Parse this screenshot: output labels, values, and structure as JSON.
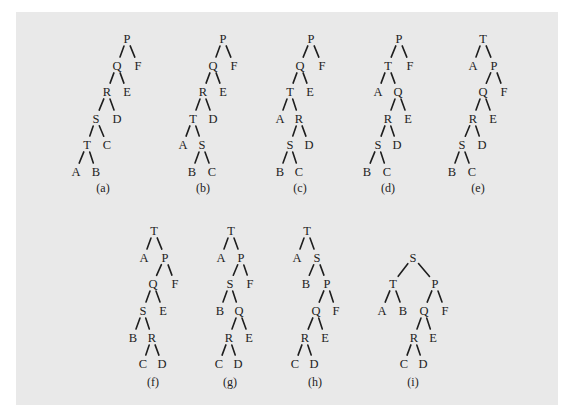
{
  "figure": {
    "background": "#e9e9e9",
    "ink_color": "#222222",
    "trees": [
      {
        "caption": "(a)",
        "caption_pos": [
          103,
          188
        ],
        "nodes": {
          "P": [
            127,
            38
          ],
          "Q": [
            117,
            65
          ],
          "F": [
            138,
            65
          ],
          "R": [
            107,
            91
          ],
          "E": [
            127,
            91
          ],
          "S": [
            96,
            118
          ],
          "D": [
            117,
            118
          ],
          "T": [
            87,
            144
          ],
          "C": [
            107,
            144
          ],
          "A": [
            76,
            171
          ],
          "B": [
            96,
            171
          ]
        },
        "edges": [
          [
            "P",
            "Q"
          ],
          [
            "P",
            "F"
          ],
          [
            "Q",
            "R"
          ],
          [
            "Q",
            "E"
          ],
          [
            "R",
            "S"
          ],
          [
            "R",
            "D"
          ],
          [
            "S",
            "T"
          ],
          [
            "S",
            "C"
          ],
          [
            "T",
            "A"
          ],
          [
            "T",
            "B"
          ]
        ]
      },
      {
        "caption": "(b)",
        "caption_pos": [
          203,
          188
        ],
        "nodes": {
          "P": [
            223,
            38
          ],
          "Q": [
            213,
            65
          ],
          "F": [
            234,
            65
          ],
          "R": [
            203,
            91
          ],
          "E": [
            223,
            91
          ],
          "T": [
            193,
            118
          ],
          "D": [
            213,
            118
          ],
          "A": [
            183,
            144
          ],
          "S": [
            202,
            144
          ],
          "B": [
            192,
            171
          ],
          "C": [
            212,
            171
          ]
        },
        "edges": [
          [
            "P",
            "Q"
          ],
          [
            "P",
            "F"
          ],
          [
            "Q",
            "R"
          ],
          [
            "Q",
            "E"
          ],
          [
            "R",
            "T"
          ],
          [
            "R",
            "D"
          ],
          [
            "T",
            "A"
          ],
          [
            "T",
            "S"
          ],
          [
            "S",
            "B"
          ],
          [
            "S",
            "C"
          ]
        ]
      },
      {
        "caption": "(c)",
        "caption_pos": [
          300,
          188
        ],
        "nodes": {
          "P": [
            311,
            38
          ],
          "Q": [
            300,
            65
          ],
          "F": [
            322,
            65
          ],
          "T": [
            290,
            91
          ],
          "E": [
            310,
            91
          ],
          "A": [
            280,
            118
          ],
          "R": [
            299,
            118
          ],
          "S": [
            290,
            144
          ],
          "D": [
            309,
            144
          ],
          "B": [
            280,
            171
          ],
          "C": [
            299,
            171
          ]
        },
        "edges": [
          [
            "P",
            "Q"
          ],
          [
            "P",
            "F"
          ],
          [
            "Q",
            "T"
          ],
          [
            "Q",
            "E"
          ],
          [
            "T",
            "A"
          ],
          [
            "T",
            "R"
          ],
          [
            "R",
            "S"
          ],
          [
            "R",
            "D"
          ],
          [
            "S",
            "B"
          ],
          [
            "S",
            "C"
          ]
        ]
      },
      {
        "caption": "(d)",
        "caption_pos": [
          388,
          188
        ],
        "nodes": {
          "P": [
            399,
            38
          ],
          "T": [
            388,
            65
          ],
          "F": [
            410,
            65
          ],
          "A": [
            378,
            91
          ],
          "Q": [
            398,
            91
          ],
          "R": [
            388,
            118
          ],
          "E": [
            408,
            118
          ],
          "S": [
            378,
            144
          ],
          "D": [
            397,
            144
          ],
          "B": [
            367,
            171
          ],
          "C": [
            387,
            171
          ]
        },
        "edges": [
          [
            "P",
            "T"
          ],
          [
            "P",
            "F"
          ],
          [
            "T",
            "A"
          ],
          [
            "T",
            "Q"
          ],
          [
            "Q",
            "R"
          ],
          [
            "Q",
            "E"
          ],
          [
            "R",
            "S"
          ],
          [
            "R",
            "D"
          ],
          [
            "S",
            "B"
          ],
          [
            "S",
            "C"
          ]
        ]
      },
      {
        "caption": "(e)",
        "caption_pos": [
          478,
          188
        ],
        "nodes": {
          "T": [
            483,
            38
          ],
          "A": [
            473,
            65
          ],
          "P": [
            494,
            65
          ],
          "Q": [
            483,
            91
          ],
          "F": [
            504,
            91
          ],
          "R": [
            473,
            118
          ],
          "E": [
            493,
            118
          ],
          "S": [
            462,
            144
          ],
          "D": [
            482,
            144
          ],
          "B": [
            452,
            171
          ],
          "C": [
            472,
            171
          ]
        },
        "edges": [
          [
            "T",
            "A"
          ],
          [
            "T",
            "P"
          ],
          [
            "P",
            "Q"
          ],
          [
            "P",
            "F"
          ],
          [
            "Q",
            "R"
          ],
          [
            "Q",
            "E"
          ],
          [
            "R",
            "S"
          ],
          [
            "R",
            "D"
          ],
          [
            "S",
            "B"
          ],
          [
            "S",
            "C"
          ]
        ]
      },
      {
        "caption": "(f)",
        "caption_pos": [
          153,
          382
        ],
        "nodes": {
          "T": [
            154,
            230
          ],
          "A": [
            144,
            257
          ],
          "P": [
            165,
            257
          ],
          "Q": [
            153,
            283
          ],
          "F": [
            175,
            283
          ],
          "S": [
            143,
            310
          ],
          "E": [
            163,
            310
          ],
          "B": [
            133,
            337
          ],
          "R": [
            152,
            337
          ],
          "C": [
            143,
            363
          ],
          "D": [
            162,
            363
          ]
        },
        "edges": [
          [
            "T",
            "A"
          ],
          [
            "T",
            "P"
          ],
          [
            "P",
            "Q"
          ],
          [
            "P",
            "F"
          ],
          [
            "Q",
            "S"
          ],
          [
            "Q",
            "E"
          ],
          [
            "S",
            "B"
          ],
          [
            "S",
            "R"
          ],
          [
            "R",
            "C"
          ],
          [
            "R",
            "D"
          ]
        ]
      },
      {
        "caption": "(g)",
        "caption_pos": [
          230,
          382
        ],
        "nodes": {
          "T": [
            231,
            230
          ],
          "A": [
            221,
            257
          ],
          "P": [
            241,
            257
          ],
          "S": [
            230,
            283
          ],
          "F": [
            250,
            283
          ],
          "B": [
            220,
            310
          ],
          "Q": [
            239,
            310
          ],
          "R": [
            229,
            337
          ],
          "E": [
            249,
            337
          ],
          "C": [
            219,
            363
          ],
          "D": [
            238,
            363
          ]
        },
        "edges": [
          [
            "T",
            "A"
          ],
          [
            "T",
            "P"
          ],
          [
            "P",
            "S"
          ],
          [
            "P",
            "F"
          ],
          [
            "S",
            "B"
          ],
          [
            "S",
            "Q"
          ],
          [
            "Q",
            "R"
          ],
          [
            "Q",
            "E"
          ],
          [
            "R",
            "C"
          ],
          [
            "R",
            "D"
          ]
        ]
      },
      {
        "caption": "(h)",
        "caption_pos": [
          315,
          382
        ],
        "nodes": {
          "T": [
            307,
            230
          ],
          "A": [
            297,
            257
          ],
          "S": [
            317,
            257
          ],
          "B": [
            306,
            283
          ],
          "P": [
            327,
            283
          ],
          "Q": [
            316,
            310
          ],
          "F": [
            336,
            310
          ],
          "R": [
            305,
            337
          ],
          "E": [
            325,
            337
          ],
          "C": [
            295,
            363
          ],
          "D": [
            314,
            363
          ]
        },
        "edges": [
          [
            "T",
            "A"
          ],
          [
            "T",
            "S"
          ],
          [
            "S",
            "B"
          ],
          [
            "S",
            "P"
          ],
          [
            "P",
            "Q"
          ],
          [
            "P",
            "F"
          ],
          [
            "Q",
            "R"
          ],
          [
            "Q",
            "E"
          ],
          [
            "R",
            "C"
          ],
          [
            "R",
            "D"
          ]
        ]
      },
      {
        "caption": "(i)",
        "caption_pos": [
          413,
          382
        ],
        "nodes": {
          "S": [
            413,
            257
          ],
          "T": [
            393,
            283
          ],
          "P": [
            435,
            283
          ],
          "A": [
            382,
            310
          ],
          "B": [
            403,
            310
          ],
          "Q": [
            424,
            310
          ],
          "F": [
            445,
            310
          ],
          "R": [
            414,
            337
          ],
          "E": [
            433,
            337
          ],
          "C": [
            404,
            363
          ],
          "D": [
            423,
            363
          ]
        },
        "edges": [
          [
            "S",
            "T"
          ],
          [
            "S",
            "P"
          ],
          [
            "T",
            "A"
          ],
          [
            "T",
            "B"
          ],
          [
            "P",
            "Q"
          ],
          [
            "P",
            "F"
          ],
          [
            "Q",
            "R"
          ],
          [
            "Q",
            "E"
          ],
          [
            "R",
            "C"
          ],
          [
            "R",
            "D"
          ]
        ]
      }
    ]
  }
}
